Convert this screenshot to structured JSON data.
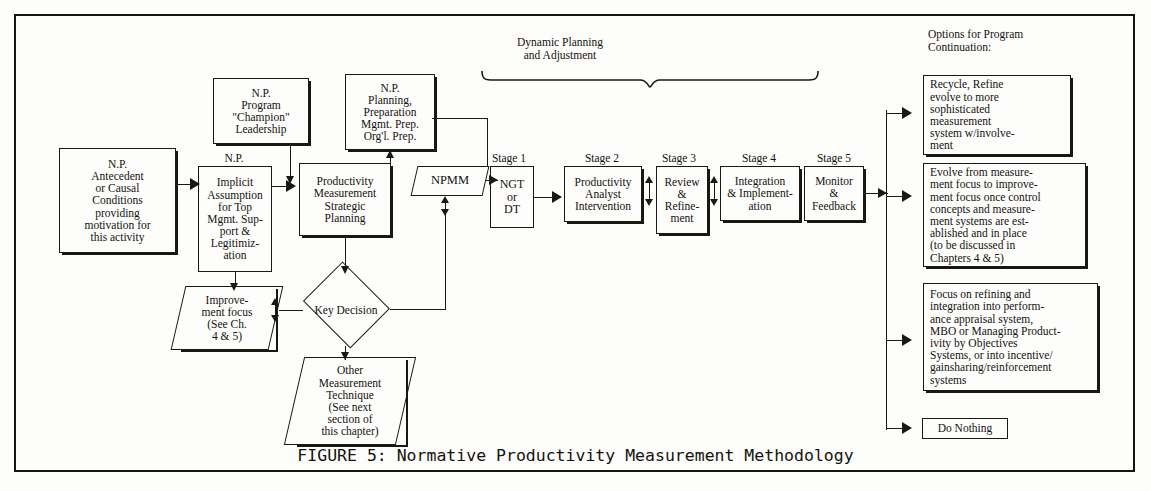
{
  "figure": {
    "caption": "FIGURE 5:  Normative Productivity Measurement Methodology",
    "dynamic_label": "Dynamic Planning\nand Adjustment",
    "options_header": "Options for Program\nContinuation:"
  },
  "nodes": {
    "antecedent": "N.P.\nAntecedent\nor Causal\nConditions\nproviding\nmotivation for\nthis activity",
    "champion": "N.P.\nProgram\n\"Champion\"\nLeadership",
    "implicit": "Implicit\nAssumption\nfor Top\nMgmt. Sup-\nport &\nLegitimiz-\nation",
    "implicit_title": "N.P.",
    "planning_prep": "N.P.\nPlanning,\nPreparation\nMgmt. Prep.\nOrg'l. Prep.",
    "strategic": "Productivity\nMeasurement\nStrategic\nPlanning",
    "improvement": "Improve-\nment focus\n(See Ch.\n4 & 5)",
    "key_decision": "Key\nDecision",
    "other_technique": "Other\nMeasurement\nTechnique\n(See next\nsection of\nthis chapter)",
    "npmm": "NPMM"
  },
  "stages": [
    {
      "caption": "Stage 1",
      "label": "NGT\nor\nDT"
    },
    {
      "caption": "Stage 2",
      "label": "Productivity\nAnalyst\nIntervention"
    },
    {
      "caption": "Stage 3",
      "label": "Review\n&\nRefine-\nment"
    },
    {
      "caption": "Stage 4",
      "label": "Integration\n& Implement-\nation"
    },
    {
      "caption": "Stage 5",
      "label": "Monitor\n&\nFeedback"
    }
  ],
  "options": [
    "Recycle, Refine\nevolve to more\nsophisticated\nmeasurement\nsystem w/involve-\nment",
    "Evolve from measure-\nment focus to improve-\nment focus once control\nconcepts and measure-\nment systems are est-\nablished and in place\n(to be discussed in\nChapters 4 & 5)",
    "Focus on refining and\nintegration into perform-\nance appraisal system,\nMBO or Managing Product-\nivity by Objectives\nSystems, or into incentive/\ngainsharing/reinforcement\nsystems",
    "Do Nothing"
  ],
  "colors": {
    "ink": "#1a1813",
    "paper": "#fdfdfc"
  }
}
